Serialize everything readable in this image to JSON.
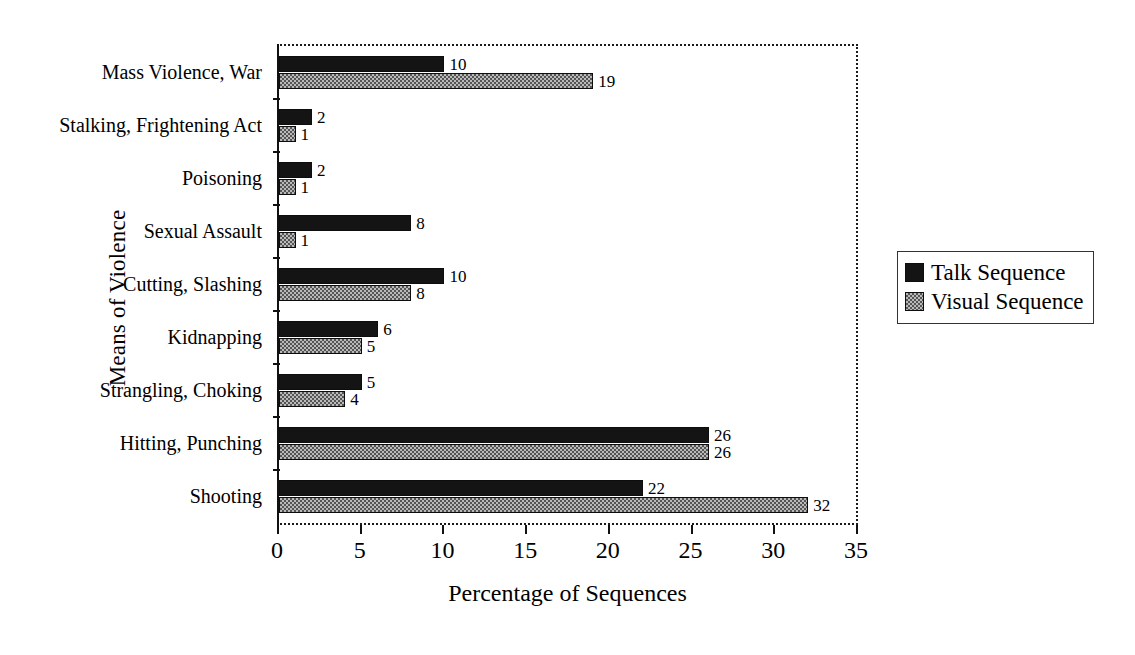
{
  "chart_data": {
    "type": "bar",
    "orientation": "horizontal",
    "title": "",
    "xlabel": "Percentage of Sequences",
    "ylabel": "Means of Violence",
    "xlim": [
      0,
      35
    ],
    "xticks": [
      0,
      5,
      10,
      15,
      20,
      25,
      30,
      35
    ],
    "grid": false,
    "legend_position": "right",
    "categories": [
      "Mass Violence, War",
      "Stalking, Frightening Act",
      "Poisoning",
      "Sexual Assault",
      "Cutting, Slashing",
      "Kidnapping",
      "Strangling, Choking",
      "Hitting, Punching",
      "Shooting"
    ],
    "series": [
      {
        "name": "Talk Sequence",
        "color": "#141414",
        "values": [
          10,
          2,
          2,
          8,
          10,
          6,
          5,
          26,
          22
        ]
      },
      {
        "name": "Visual Sequence",
        "color": "#b9b9b9",
        "values": [
          19,
          1,
          1,
          1,
          8,
          5,
          4,
          26,
          32
        ]
      }
    ]
  },
  "legend": {
    "items": [
      {
        "label": "Talk Sequence",
        "swatch": "talk"
      },
      {
        "label": "Visual Sequence",
        "swatch": "visual"
      }
    ]
  }
}
